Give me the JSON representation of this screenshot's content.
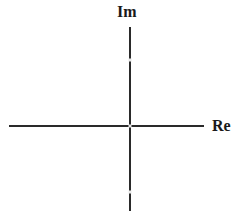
{
  "diagram": {
    "type": "complex-plane-axes",
    "axes": {
      "horizontal": {
        "label": "Re",
        "x_start": 9,
        "x_end": 204,
        "y": 126
      },
      "vertical": {
        "label": "Im",
        "x": 130,
        "y_start": 27,
        "y_end": 211
      }
    },
    "markers": [
      {
        "name": "upper-mark",
        "x": 130,
        "y": 60
      },
      {
        "name": "origin",
        "x": 130,
        "y": 126
      },
      {
        "name": "lower-mark",
        "x": 130,
        "y": 192
      }
    ],
    "colors": {
      "axis": "#2a2a2a",
      "label": "#1a1a1a",
      "marker": "#e8e8e8",
      "background": "#ffffff"
    }
  }
}
